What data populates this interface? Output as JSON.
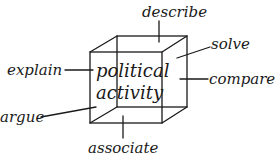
{
  "diagram": {
    "center_label": {
      "line1": "political",
      "line2": "activity"
    },
    "labels": {
      "top": "describe",
      "top_right": "solve",
      "right": "compare",
      "left": "explain",
      "bottom_left": "argue",
      "bottom": "associate"
    },
    "colors": {
      "ink": "#1a1a1a",
      "background": "#ffffff"
    }
  }
}
